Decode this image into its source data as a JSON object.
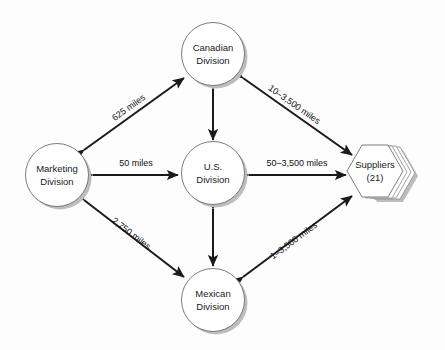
{
  "diagram": {
    "background_color": "#fdfdfd",
    "line_color": "#1a1a1a",
    "node_stroke_color": "#6e6e6e",
    "shadow_color": "#bdbdbd",
    "nodes": [
      {
        "id": "canadian",
        "shape": "circle",
        "line1": "Canadian",
        "line2": "Division"
      },
      {
        "id": "marketing",
        "shape": "circle",
        "line1": "Marketing",
        "line2": "Division"
      },
      {
        "id": "us",
        "shape": "circle",
        "line1": "U.S.",
        "line2": "Division"
      },
      {
        "id": "mexican",
        "shape": "circle",
        "line1": "Mexican",
        "line2": "Division"
      },
      {
        "id": "suppliers",
        "shape": "hexagon-stack",
        "line1": "Suppliers",
        "line2": "(21)"
      }
    ],
    "edges": [
      {
        "id": "marketing-canadian",
        "from": "marketing",
        "to": "canadian",
        "label": "625 miles",
        "arrows": "both"
      },
      {
        "id": "canadian-suppliers",
        "from": "canadian",
        "to": "suppliers",
        "label": "10–3,500 miles",
        "arrows": "both"
      },
      {
        "id": "marketing-us",
        "from": "marketing",
        "to": "us",
        "label": "50 miles",
        "arrows": "both"
      },
      {
        "id": "us-suppliers",
        "from": "us",
        "to": "suppliers",
        "label": "50–3,500 miles",
        "arrows": "both"
      },
      {
        "id": "marketing-mexican",
        "from": "marketing",
        "to": "mexican",
        "label": "2,750 miles",
        "arrows": "both"
      },
      {
        "id": "mexican-suppliers",
        "from": "mexican",
        "to": "suppliers",
        "label": "1–3,500 miles",
        "arrows": "both"
      },
      {
        "id": "canadian-us",
        "from": "canadian",
        "to": "us",
        "label": "",
        "arrows": "both"
      },
      {
        "id": "us-mexican",
        "from": "us",
        "to": "mexican",
        "label": "",
        "arrows": "both"
      }
    ]
  }
}
